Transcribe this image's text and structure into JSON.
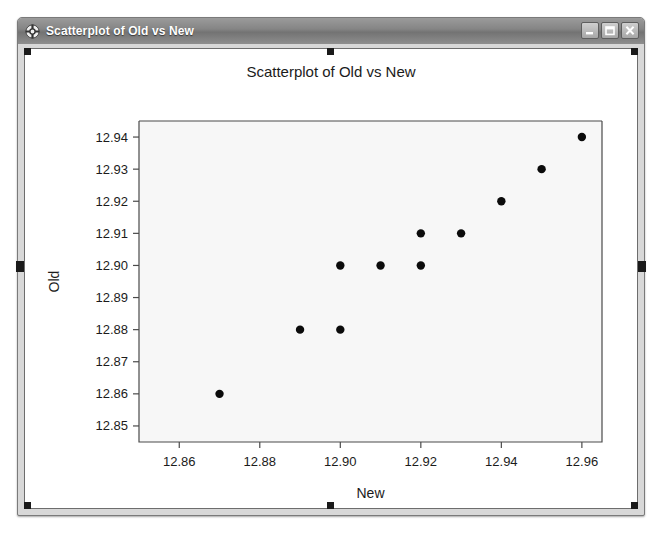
{
  "window": {
    "title": "Scatterplot of Old vs New",
    "icon": "crosshair-window-icon",
    "buttons": {
      "minimize": "minimize-button",
      "maximize": "maximize-button",
      "close": "close-button"
    }
  },
  "chart_data": {
    "type": "scatter",
    "title": "Scatterplot of Old vs New",
    "xlabel": "New",
    "ylabel": "Old",
    "xlim": [
      12.85,
      12.965
    ],
    "ylim": [
      12.845,
      12.945
    ],
    "xticks": [
      "12.86",
      "12.88",
      "12.90",
      "12.92",
      "12.94",
      "12.96"
    ],
    "xtick_values": [
      12.86,
      12.88,
      12.9,
      12.92,
      12.94,
      12.96
    ],
    "yticks": [
      "12.85",
      "12.86",
      "12.87",
      "12.88",
      "12.89",
      "12.90",
      "12.91",
      "12.92",
      "12.93",
      "12.94"
    ],
    "ytick_values": [
      12.85,
      12.86,
      12.87,
      12.88,
      12.89,
      12.9,
      12.91,
      12.92,
      12.93,
      12.94
    ],
    "grid": false,
    "legend": "none",
    "marker": "filled-circle",
    "marker_color": "#0b0b0b",
    "plot_background": "#f7f7f7",
    "x": [
      12.87,
      12.89,
      12.9,
      12.9,
      12.91,
      12.92,
      12.92,
      12.93,
      12.94,
      12.95,
      12.96
    ],
    "y": [
      12.86,
      12.88,
      12.88,
      12.9,
      12.9,
      12.9,
      12.91,
      12.91,
      12.92,
      12.93,
      12.94
    ],
    "points": [
      {
        "x": 12.87,
        "y": 12.86
      },
      {
        "x": 12.89,
        "y": 12.88
      },
      {
        "x": 12.9,
        "y": 12.88
      },
      {
        "x": 12.9,
        "y": 12.9
      },
      {
        "x": 12.91,
        "y": 12.9
      },
      {
        "x": 12.92,
        "y": 12.9
      },
      {
        "x": 12.92,
        "y": 12.91
      },
      {
        "x": 12.93,
        "y": 12.91
      },
      {
        "x": 12.94,
        "y": 12.92
      },
      {
        "x": 12.95,
        "y": 12.93
      },
      {
        "x": 12.96,
        "y": 12.94
      }
    ]
  }
}
